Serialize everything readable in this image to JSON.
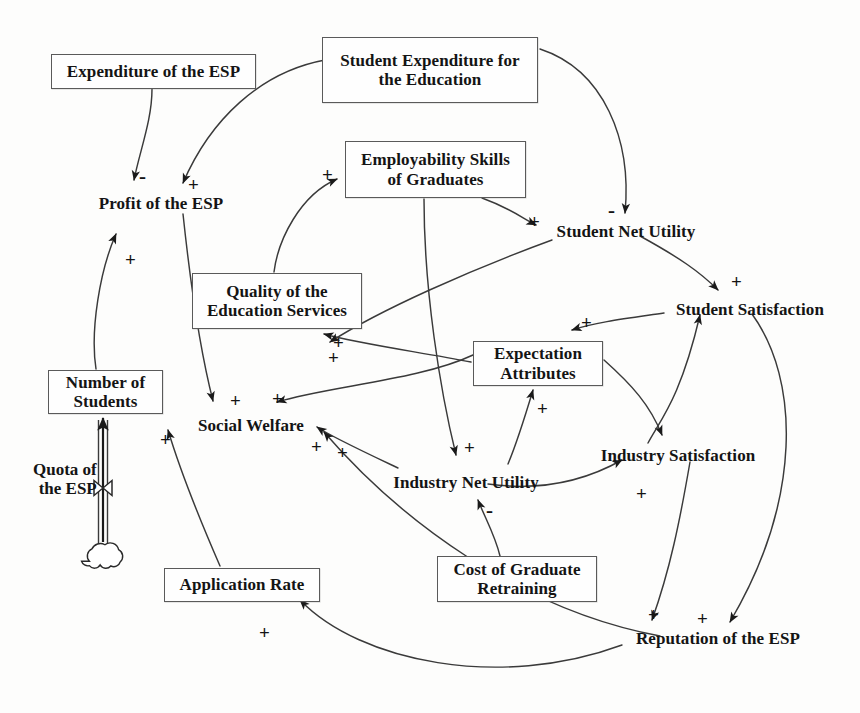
{
  "diagram": {
    "type": "causal-loop-diagram",
    "width": 860,
    "height": 713,
    "background_color": "#fdfdfc",
    "line_color": "#3a3a3a",
    "text_color": "#141414",
    "box_border_color": "#5a5a5a"
  },
  "nodes": [
    {
      "id": "expenditure_esp",
      "label": "Expenditure of the ESP",
      "shape": "box",
      "x": 51,
      "y": 54,
      "w": 205,
      "h": 35,
      "font_size": 17
    },
    {
      "id": "student_expenditure",
      "label": "Student Expenditure for\nthe Education",
      "shape": "box",
      "x": 322,
      "y": 37,
      "w": 216,
      "h": 66,
      "font_size": 17
    },
    {
      "id": "employability",
      "label": "Employability Skills\nof Graduates",
      "shape": "box",
      "x": 345,
      "y": 141,
      "w": 181,
      "h": 57,
      "font_size": 17
    },
    {
      "id": "quality_education",
      "label": "Quality of the\nEducation Services",
      "shape": "box",
      "x": 192,
      "y": 273,
      "w": 170,
      "h": 56,
      "font_size": 17
    },
    {
      "id": "number_students",
      "label": "Number of\nStudents",
      "shape": "box",
      "x": 48,
      "y": 370,
      "w": 115,
      "h": 44,
      "font_size": 17
    },
    {
      "id": "expectation_attr",
      "label": "Expectation\nAttributes",
      "shape": "box",
      "x": 473,
      "y": 341,
      "w": 130,
      "h": 45,
      "font_size": 17
    },
    {
      "id": "application_rate",
      "label": "Application Rate",
      "shape": "box",
      "x": 164,
      "y": 568,
      "w": 156,
      "h": 34,
      "font_size": 17
    },
    {
      "id": "cost_retraining",
      "label": "Cost of Graduate\nRetraining",
      "shape": "box",
      "x": 437,
      "y": 556,
      "w": 160,
      "h": 46,
      "font_size": 17
    },
    {
      "id": "profit_esp",
      "label": "Profit of the ESP",
      "shape": "plain",
      "x": 86,
      "y": 194,
      "w": 150,
      "h": 22,
      "font_size": 17
    },
    {
      "id": "student_net_utility",
      "label": "Student Net Utility",
      "shape": "plain",
      "x": 546,
      "y": 222,
      "w": 160,
      "h": 22,
      "font_size": 17
    },
    {
      "id": "student_satisfaction",
      "label": "Student Satisfaction",
      "shape": "plain",
      "x": 664,
      "y": 300,
      "w": 172,
      "h": 22,
      "font_size": 17
    },
    {
      "id": "social_welfare",
      "label": "Social Welfare",
      "shape": "plain",
      "x": 187,
      "y": 416,
      "w": 128,
      "h": 22,
      "font_size": 17
    },
    {
      "id": "industry_net_utility",
      "label": "Industry Net Utility",
      "shape": "plain",
      "x": 386,
      "y": 473,
      "w": 160,
      "h": 22,
      "font_size": 17
    },
    {
      "id": "industry_satisfaction",
      "label": "Industry Satisfaction",
      "shape": "plain",
      "x": 592,
      "y": 446,
      "w": 172,
      "h": 22,
      "font_size": 17
    },
    {
      "id": "reputation_esp",
      "label": "Reputation of the ESP",
      "shape": "plain",
      "x": 625,
      "y": 629,
      "w": 186,
      "h": 22,
      "font_size": 17
    }
  ],
  "flow": {
    "label": "Quota of\nthe ESP",
    "label_x": 33,
    "label_y": 460,
    "label_font_size": 17,
    "source_cloud": {
      "cx": 103,
      "cy": 558,
      "r": 13
    },
    "valve": {
      "cx": 103,
      "cy": 488,
      "w": 18,
      "h": 15
    },
    "pipe": {
      "x": 103,
      "y_top": 414,
      "y_bottom": 548,
      "width": 9
    },
    "target_node": "number_students"
  },
  "links": [
    {
      "id": "l1",
      "from": "expenditure_esp",
      "to": "profit_esp",
      "sign": "-",
      "sign_x": 139,
      "sign_y": 166
    },
    {
      "id": "l2",
      "from": "student_expenditure",
      "to": "profit_esp",
      "sign": "+",
      "sign_x": 188,
      "sign_y": 175
    },
    {
      "id": "l3",
      "from": "student_expenditure",
      "to": "student_net_utility",
      "sign": "-",
      "sign_x": 608,
      "sign_y": 200
    },
    {
      "id": "l4",
      "from": "quality_education",
      "to": "employability",
      "sign": "+",
      "sign_x": 322,
      "sign_y": 165
    },
    {
      "id": "l5",
      "from": "employability",
      "to": "student_net_utility",
      "sign": "+",
      "sign_x": 529,
      "sign_y": 212
    },
    {
      "id": "l6",
      "from": "employability",
      "to": "industry_net_utility",
      "sign": "+",
      "sign_x": 464,
      "sign_y": 438
    },
    {
      "id": "l7",
      "from": "number_students",
      "to": "profit_esp",
      "sign": "+",
      "sign_x": 125,
      "sign_y": 250
    },
    {
      "id": "l8",
      "from": "profit_esp",
      "to": "social_welfare",
      "sign": "+",
      "sign_x": 230,
      "sign_y": 391
    },
    {
      "id": "l9",
      "from": "expectation_attr",
      "to": "quality_education",
      "sign": "+",
      "sign_x": 328,
      "sign_y": 348
    },
    {
      "id": "l10",
      "from": "expectation_attr",
      "to": "social_welfare",
      "sign": "+",
      "sign_x": 272,
      "sign_y": 389
    },
    {
      "id": "l11",
      "from": "student_net_utility",
      "to": "social_welfare",
      "sign": "+",
      "sign_x": 333,
      "sign_y": 333
    },
    {
      "id": "l12",
      "from": "student_net_utility",
      "to": "student_satisfaction",
      "sign": "+",
      "sign_x": 731,
      "sign_y": 272
    },
    {
      "id": "l13",
      "from": "student_satisfaction",
      "to": "expectation_attr",
      "sign": "+",
      "sign_x": 581,
      "sign_y": 313
    },
    {
      "id": "l14",
      "from": "expectation_attr",
      "to": "industry_satisfaction",
      "sign": "",
      "sign_x": 0,
      "sign_y": 0
    },
    {
      "id": "l15",
      "from": "industry_satisfaction",
      "to": "student_satisfaction",
      "sign": "",
      "sign_x": 0,
      "sign_y": 0
    },
    {
      "id": "l16",
      "from": "industry_net_utility",
      "to": "expectation_attr",
      "sign": "+",
      "sign_x": 537,
      "sign_y": 399
    },
    {
      "id": "l17",
      "from": "industry_net_utility",
      "to": "social_welfare",
      "sign": "+",
      "sign_x": 337,
      "sign_y": 443
    },
    {
      "id": "l18",
      "from": "industry_net_utility",
      "to": "industry_satisfaction",
      "sign": "+",
      "sign_x": 636,
      "sign_y": 484
    },
    {
      "id": "l19",
      "from": "cost_retraining",
      "to": "industry_net_utility",
      "sign": "-",
      "sign_x": 486,
      "sign_y": 500
    },
    {
      "id": "l20",
      "from": "industry_satisfaction",
      "to": "reputation_esp",
      "sign": "+",
      "sign_x": 648,
      "sign_y": 605
    },
    {
      "id": "l21",
      "from": "student_satisfaction",
      "to": "reputation_esp",
      "sign": "+",
      "sign_x": 697,
      "sign_y": 609
    },
    {
      "id": "l22",
      "from": "reputation_esp",
      "to": "application_rate",
      "sign": "+",
      "sign_x": 259,
      "sign_y": 623
    },
    {
      "id": "l23",
      "from": "application_rate",
      "to": "number_students",
      "sign": "+",
      "sign_x": 160,
      "sign_y": 430
    },
    {
      "id": "l24",
      "from": "reputation_esp",
      "to": "social_welfare",
      "sign": "+",
      "sign_x": 311,
      "sign_y": 437
    }
  ],
  "paths": {
    "l1": "M 152,89 C 152,120 140,150 134,180",
    "l2": "M 325,60 C 260,72 210,120 183,183",
    "l3": "M 540,49 C 604,70 632,140 625,213",
    "l4": "M 274,272 C 278,240 300,195 337,179",
    "l5": "M 482,198 C 510,208 522,218 536,225",
    "l6": "M 424,199 C 424,290 440,390 456,455",
    "l7": "M 96,369 C 90,330 100,270 116,234",
    "l8": "M 183,214 C 190,280 200,350 213,401",
    "l9": "M 471,362 C 420,352 360,344 324,334",
    "l10": "M 473,355 C 420,380 330,386 277,402",
    "l11": "M 552,240 C 470,270 380,310 330,342",
    "l12": "M 640,236 C 680,258 700,272 718,290",
    "l13": "M 664,313 C 630,318 596,322 572,330",
    "l14": "M 604,360 C 632,385 650,405 662,435",
    "l15": "M 648,443 C 660,420 680,400 700,315",
    "l16": "M 508,464 C 518,440 524,420 533,390",
    "l17": "M 398,468 C 360,450 330,436 317,427",
    "l18": "M 488,484 C 545,492 590,478 622,460",
    "l19": "M 500,556 C 495,535 485,518 478,500",
    "l20": "M 690,462 C 680,520 670,570 652,620",
    "l21": "M 752,314 C 800,380 802,500 730,622",
    "l22": "M 622,645 C 500,690 360,662 300,600",
    "l23": "M 220,566 C 200,520 180,470 168,430",
    "l24": "M 660,636 C 520,610 400,520 324,432"
  }
}
